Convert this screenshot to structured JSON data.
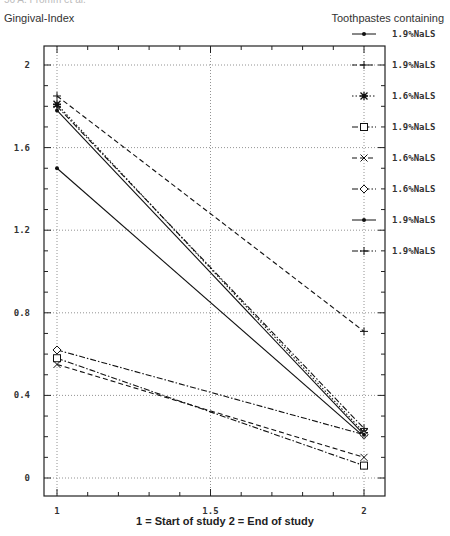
{
  "page": {
    "header_fragment": "56        A. Fromm et al.",
    "y_axis_title": "Gingival-Index",
    "legend_title": "Toothpastes containing",
    "x_axis_title": "1 = Start of study     2 = End of study"
  },
  "chart_data": {
    "type": "line",
    "title": "",
    "xlabel": "1 = Start of study     2 = End of study",
    "ylabel": "Gingival-Index",
    "x": [
      1,
      2
    ],
    "xlim": [
      0.92,
      2.07
    ],
    "ylim": [
      -0.09,
      2.09
    ],
    "x_ticks": [
      1,
      1.5,
      2
    ],
    "x_tick_labels": [
      "1",
      "1.5",
      "2"
    ],
    "y_ticks": [
      0,
      0.4,
      0.8,
      1.2,
      1.6,
      2
    ],
    "y_tick_labels": [
      "0",
      "0.4",
      "0.8",
      "1.2",
      "1.6",
      "2"
    ],
    "grid": "dotted at major ticks",
    "legend_position": "right, outside plot",
    "legend_title": "Toothpastes containing",
    "series": [
      {
        "name": "1.9%NaLS",
        "marker": "dot",
        "line": "solid",
        "values": [
          1.5,
          0.2
        ]
      },
      {
        "name": "1.9%NaLS",
        "marker": "plus",
        "line": "dashed",
        "values": [
          1.85,
          0.71
        ]
      },
      {
        "name": "1.6%NaLS",
        "marker": "star",
        "line": "dotted",
        "values": [
          1.81,
          0.22
        ]
      },
      {
        "name": "1.9%NaLS",
        "marker": "square",
        "line": "dash-dot",
        "values": [
          0.58,
          0.06
        ]
      },
      {
        "name": "1.6%NaLS",
        "marker": "x",
        "line": "dashed",
        "values": [
          0.55,
          0.1
        ]
      },
      {
        "name": "1.6%NaLS",
        "marker": "diamond",
        "line": "dash-dot",
        "values": [
          0.62,
          0.21
        ]
      },
      {
        "name": "1.9%NaLS",
        "marker": "dot",
        "line": "solid",
        "values": [
          1.78,
          0.21
        ]
      },
      {
        "name": "1.9%NaLS",
        "marker": "plus",
        "line": "dash-dot",
        "values": [
          1.8,
          0.24
        ]
      }
    ]
  }
}
